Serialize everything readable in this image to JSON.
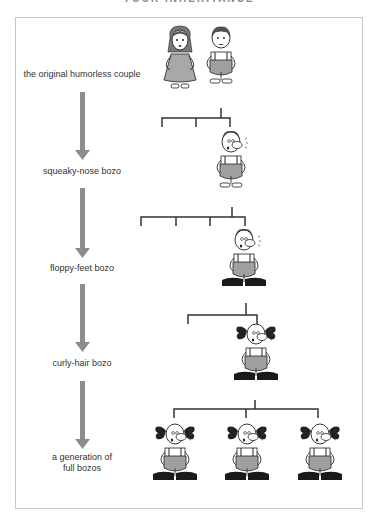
{
  "header": {
    "title": "YOUR INHERITANCE"
  },
  "colors": {
    "arrow": "#8c8c8c",
    "bracket": "#333333",
    "frame": "#c8c8c8",
    "overalls": "#a0a0a0",
    "shoes": "#1a1a1a",
    "dress": "#a8a8a8"
  },
  "stages": [
    {
      "label": "the original humorless couple",
      "count": 2
    },
    {
      "label": "squeaky-nose bozo",
      "count": 1
    },
    {
      "label": "floppy-feet bozo",
      "count": 1
    },
    {
      "label": "curly-hair bozo",
      "count": 1
    },
    {
      "label_line1": "a generation of",
      "label_line2": "full bozos",
      "count": 3
    }
  ]
}
